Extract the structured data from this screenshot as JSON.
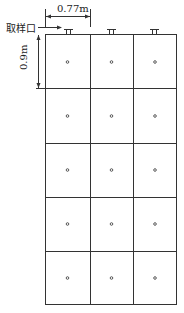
{
  "labels": {
    "width_dim": "0.77m",
    "height_dim": "0.9m",
    "sampling_port": "取样口"
  },
  "grid": {
    "columns": 3,
    "rows": 5
  },
  "colors": {
    "line": "#333333"
  }
}
